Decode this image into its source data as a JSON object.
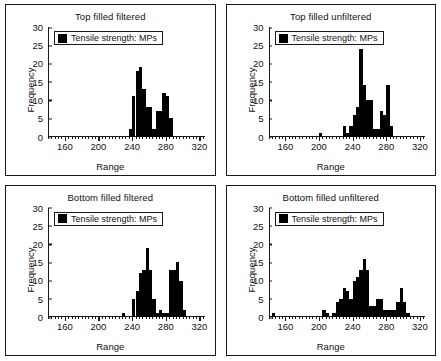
{
  "figure": {
    "panel_count": 4,
    "background_color": "#ffffff",
    "border_color": "#1a1a1a",
    "bar_color": "#000000"
  },
  "legend": {
    "label": "Tensile strength: MPs",
    "swatch_color": "#000000",
    "swatch_name": "legend-swatch"
  },
  "axis": {
    "xlabel": "Range",
    "ylabel": "Frequency",
    "xticks": [
      160,
      200,
      240,
      280,
      320
    ],
    "yticks": [
      0,
      5,
      10,
      15,
      20,
      25,
      30
    ],
    "xlim": [
      140,
      326
    ],
    "ylim": [
      0,
      30
    ],
    "minor_tick_step": 4
  },
  "chart_data": [
    {
      "type": "bar",
      "id": "top-filled-filtered",
      "title": "Top filled filtered",
      "xlabel": "Range",
      "ylabel": "Frequency",
      "xlim": [
        140,
        326
      ],
      "ylim": [
        0,
        30
      ],
      "grid": false,
      "legend_position": "top-left",
      "legend": "Tensile strength: MPs",
      "bin_width": 4,
      "bins": [
        236,
        240,
        244,
        248,
        252,
        256,
        260,
        264,
        268,
        272,
        276,
        280,
        284
      ],
      "values": [
        2,
        11,
        18,
        19,
        13,
        8,
        8,
        2,
        7,
        7,
        12,
        11,
        5
      ]
    },
    {
      "type": "bar",
      "id": "top-filled-unfiltered",
      "title": "Top filled unfiltered",
      "xlabel": "Range",
      "ylabel": "Frequency",
      "xlim": [
        140,
        326
      ],
      "ylim": [
        0,
        30
      ],
      "grid": false,
      "legend_position": "top-left",
      "legend": "Tensile strength: MPs",
      "bin_width": 4,
      "bins": [
        200,
        228,
        232,
        236,
        240,
        244,
        248,
        252,
        256,
        260,
        264,
        268,
        272,
        276,
        280,
        284
      ],
      "values": [
        1,
        3,
        1,
        3,
        6,
        8,
        24,
        14,
        10,
        10,
        2,
        2,
        7,
        6,
        14,
        3
      ]
    },
    {
      "type": "bar",
      "id": "bottom-filled-filtered",
      "title": "Bottom filled filtered",
      "xlabel": "Range",
      "ylabel": "Frequency",
      "xlim": [
        140,
        326
      ],
      "ylim": [
        0,
        30
      ],
      "grid": false,
      "legend_position": "top-left",
      "legend": "Tensile strength: MPs",
      "bin_width": 4,
      "bins": [
        228,
        240,
        244,
        248,
        252,
        256,
        260,
        264,
        268,
        272,
        276,
        280,
        284,
        288,
        292,
        296,
        300
      ],
      "values": [
        1,
        5,
        7,
        12,
        13,
        19,
        13,
        5,
        1,
        2,
        1,
        1,
        13,
        13,
        15,
        10,
        2
      ]
    },
    {
      "type": "bar",
      "id": "bottom-filled-unfiltered",
      "title": "Bottom filled unfiltered",
      "xlabel": "Range",
      "ylabel": "Frequency",
      "xlim": [
        140,
        326
      ],
      "ylim": [
        0,
        30
      ],
      "grid": false,
      "legend_position": "top-left",
      "legend": "Tensile strength: MPs",
      "bin_width": 4,
      "bins": [
        144,
        204,
        208,
        216,
        220,
        224,
        228,
        232,
        236,
        240,
        244,
        248,
        252,
        256,
        260,
        264,
        268,
        272,
        276,
        280,
        284,
        288,
        292,
        296,
        300,
        304
      ],
      "values": [
        1,
        2,
        1,
        1,
        4,
        5,
        8,
        7,
        5,
        10,
        11,
        13,
        16,
        13,
        3,
        3,
        5,
        5,
        2,
        2,
        2,
        2,
        4,
        8,
        4,
        1
      ]
    }
  ]
}
